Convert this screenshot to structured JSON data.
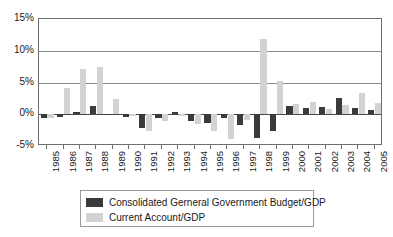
{
  "chart_data": {
    "type": "bar",
    "title": "",
    "xlabel": "",
    "ylabel": "",
    "ylim": [
      -5,
      15
    ],
    "yticks": [
      "-5%",
      "0%",
      "5%",
      "10%",
      "15%"
    ],
    "ytick_values": [
      -5,
      0,
      5,
      10,
      15
    ],
    "grid": true,
    "legend_position": "bottom",
    "categories": [
      "1985",
      "1986",
      "1987",
      "1988",
      "1989",
      "1990",
      "1991",
      "1992",
      "1993",
      "1994",
      "1995",
      "1996",
      "1997",
      "1998",
      "1999",
      "2000",
      "2001",
      "2002",
      "2003",
      "2004",
      "2005"
    ],
    "series": [
      {
        "name": "Consolidated Gerneral Government Budget/GDP",
        "color": "#3a3a3a",
        "values": [
          -0.6,
          -0.5,
          0.4,
          1.3,
          -0.1,
          -0.4,
          -2.2,
          -0.6,
          0.3,
          -1.0,
          -1.4,
          -0.6,
          -1.7,
          -3.8,
          -2.6,
          1.3,
          1.0,
          1.1,
          2.6,
          1.0,
          0.6
        ]
      },
      {
        "name": "Current Account/GDP",
        "color": "#d2d2d2",
        "values": [
          -0.6,
          4.2,
          7.1,
          7.4,
          2.4,
          -0.2,
          -2.6,
          -1.0,
          -0.2,
          -1.6,
          -2.7,
          -3.9,
          -0.9,
          11.9,
          5.3,
          1.6,
          1.9,
          0.9,
          1.5,
          3.3,
          1.7
        ]
      }
    ]
  },
  "legend": {
    "items": [
      {
        "label": "Consolidated Gerneral Government Budget/GDP",
        "color": "#3a3a3a"
      },
      {
        "label": "Current Account/GDP",
        "color": "#d2d2d2"
      }
    ]
  }
}
